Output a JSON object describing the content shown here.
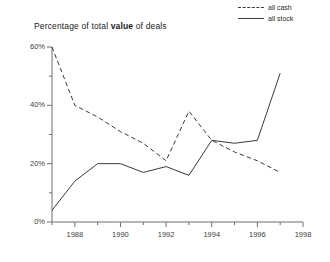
{
  "chart_data": {
    "type": "line",
    "title": "Percentage of total value of deals",
    "title_prefix": "Percentage of total ",
    "title_bold": "value",
    "title_suffix": " of deals",
    "xlabel": "",
    "ylabel": "",
    "x": [
      1987,
      1988,
      1989,
      1990,
      1991,
      1992,
      1993,
      1994,
      1995,
      1996,
      1997
    ],
    "xlim": [
      1987,
      1998
    ],
    "ylim": [
      0,
      60
    ],
    "yticks": [
      0,
      20,
      40,
      60
    ],
    "ytick_labels": [
      "0%",
      "20%",
      "40%",
      "60%"
    ],
    "yminor_step": 10,
    "xticks": [
      1987,
      1988,
      1989,
      1990,
      1991,
      1992,
      1993,
      1994,
      1995,
      1996,
      1997,
      1998
    ],
    "xtick_labels": [
      "1988",
      "1990",
      "1992",
      "1994",
      "1996",
      "1998"
    ],
    "xtick_label_values": [
      1988,
      1990,
      1992,
      1994,
      1996,
      1998
    ],
    "grid": false,
    "legend_position": "top-right",
    "series": [
      {
        "name": "all cash",
        "style": "dashed",
        "color": "#3a3a3a",
        "values": [
          60,
          40,
          36,
          31,
          27,
          21,
          38,
          28,
          24,
          21,
          17
        ]
      },
      {
        "name": "all stock",
        "style": "solid",
        "color": "#3a3a3a",
        "values": [
          4,
          14,
          20,
          20,
          17,
          19,
          16,
          28,
          27,
          28,
          51
        ]
      }
    ]
  },
  "axis_color": "#6e6e6e",
  "text_color": "#3c3c3c"
}
